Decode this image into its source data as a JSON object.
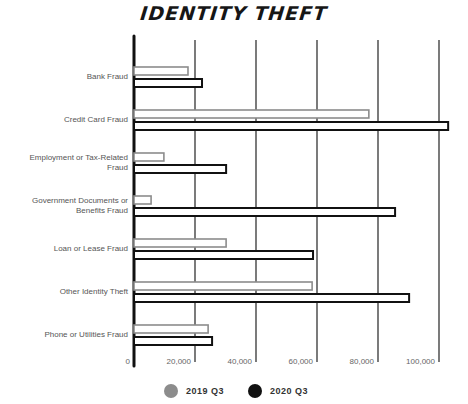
{
  "chart_data": {
    "type": "bar",
    "orientation": "horizontal",
    "title": "IDENTITY THEFT",
    "xlabel": "",
    "ylabel": "",
    "xlim": [
      0,
      105000
    ],
    "grid": true,
    "legend_position": "bottom",
    "x_ticks": [
      "0",
      "20,000",
      "40,000",
      "60,000",
      "80,000",
      "100,000"
    ],
    "x_tick_values": [
      0,
      20000,
      40000,
      60000,
      80000,
      100000
    ],
    "categories": [
      "Bank Fraud",
      "Credit Card Fraud",
      "Employment or Tax-Related Fraud",
      "Government Documents or Benefits Fraud",
      "Loan or Lease Fraud",
      "Other Identity Theft",
      "Phone or Utilities Fraud"
    ],
    "category_label_lines": [
      [
        "Bank Fraud"
      ],
      [
        "Credit Card Fraud"
      ],
      [
        "Employment or Tax-Related",
        "Fraud"
      ],
      [
        "Government Documents or",
        "Benefits Fraud"
      ],
      [
        "Loan or Lease Fraud"
      ],
      [
        "Other Identity Theft"
      ],
      [
        "Phone or Utilities Fraud"
      ]
    ],
    "series": [
      {
        "name": "2019 Q3",
        "color": "#8c8c8c",
        "values": [
          17700,
          77000,
          9800,
          5600,
          30200,
          58400,
          24300
        ]
      },
      {
        "name": "2020 Q3",
        "color": "#111111",
        "values": [
          22300,
          103000,
          30200,
          85600,
          58700,
          90200,
          25600
        ]
      }
    ]
  }
}
